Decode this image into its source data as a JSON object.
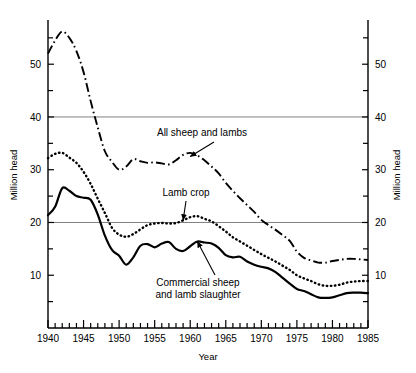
{
  "chart_data": {
    "type": "line",
    "title": "",
    "xlabel": "Year",
    "ylabel": "Million head",
    "ylabel_right": "Million head",
    "xlim": [
      1940,
      1985
    ],
    "ylim": [
      0,
      58
    ],
    "grid": "horizontal gridlines at 20 and 40",
    "gridline_values": [
      20,
      40
    ],
    "legend_position": "inline annotations with leader arrows",
    "x_tick_labels": [
      "1940",
      "1945",
      "1950",
      "1955",
      "1960",
      "1965",
      "1970",
      "1975",
      "1980",
      "1985"
    ],
    "x_tick_values": [
      1940,
      1945,
      1950,
      1955,
      1960,
      1965,
      1970,
      1975,
      1980,
      1985
    ],
    "x_minor_tick_interval": 1,
    "y_tick_labels": [
      "10",
      "20",
      "30",
      "40",
      "50"
    ],
    "y_tick_values": [
      10,
      20,
      30,
      40,
      50
    ],
    "y_minor_tick_interval": 5,
    "x": [
      1940,
      1941,
      1942,
      1943,
      1944,
      1945,
      1946,
      1947,
      1948,
      1949,
      1950,
      1951,
      1952,
      1953,
      1954,
      1955,
      1956,
      1957,
      1958,
      1959,
      1960,
      1961,
      1962,
      1963,
      1964,
      1965,
      1966,
      1967,
      1968,
      1969,
      1970,
      1971,
      1972,
      1973,
      1974,
      1975,
      1976,
      1977,
      1978,
      1979,
      1980,
      1981,
      1982,
      1983,
      1984,
      1985
    ],
    "series": [
      {
        "name": "All sheep and lambs",
        "style": "dash-dot",
        "values": [
          52.0,
          54.5,
          56.2,
          55.0,
          52.5,
          48.5,
          43.0,
          38.0,
          33.5,
          31.5,
          30.0,
          30.6,
          32.0,
          31.6,
          31.3,
          31.4,
          31.2,
          31.0,
          31.8,
          32.8,
          33.2,
          32.7,
          31.8,
          30.6,
          29.3,
          27.5,
          26.0,
          24.6,
          23.3,
          22.0,
          20.5,
          19.5,
          18.6,
          17.6,
          16.5,
          14.5,
          13.3,
          12.8,
          12.4,
          12.4,
          12.7,
          12.9,
          13.1,
          13.1,
          13.0,
          12.9
        ]
      },
      {
        "name": "Lamb crop",
        "style": "dotted",
        "values": [
          32.2,
          33.0,
          33.2,
          32.3,
          31.3,
          29.6,
          27.3,
          24.5,
          21.8,
          19.0,
          17.7,
          17.3,
          17.8,
          18.7,
          19.5,
          19.8,
          19.9,
          19.8,
          19.9,
          20.4,
          21.0,
          21.2,
          20.7,
          20.2,
          19.3,
          18.3,
          17.2,
          16.4,
          15.6,
          14.8,
          14.0,
          13.3,
          12.6,
          11.8,
          11.0,
          10.0,
          9.4,
          8.9,
          8.3,
          8.0,
          8.0,
          8.2,
          8.6,
          8.8,
          8.9,
          8.9
        ]
      },
      {
        "name": "Commercial sheep and lamb slaughter",
        "style": "solid",
        "values": [
          21.4,
          23.0,
          26.5,
          26.0,
          25.0,
          24.7,
          24.3,
          21.5,
          17.5,
          14.8,
          13.7,
          12.0,
          13.4,
          15.6,
          15.9,
          15.3,
          16.0,
          16.3,
          15.0,
          14.6,
          15.5,
          16.4,
          16.2,
          16.0,
          15.2,
          13.8,
          13.4,
          13.5,
          12.6,
          12.0,
          11.6,
          11.3,
          10.6,
          9.5,
          8.4,
          7.4,
          7.0,
          6.4,
          5.8,
          5.7,
          5.8,
          6.2,
          6.6,
          6.7,
          6.7,
          6.6
        ]
      }
    ],
    "annotations": [
      {
        "label_lines": [
          "All sheep and lambs"
        ],
        "target_year": 1960,
        "target_value": 32.5
      },
      {
        "label_lines": [
          "Lamb crop"
        ],
        "target_year": 1959,
        "target_value": 20.4
      },
      {
        "label_lines": [
          "Commercial sheep",
          "and lamb slaughter"
        ],
        "target_year": 1961,
        "target_value": 16.4
      }
    ],
    "colors": {
      "series_line": "#000000",
      "gridline": "#808080",
      "axis": "#000000",
      "background": "#ffffff"
    }
  }
}
